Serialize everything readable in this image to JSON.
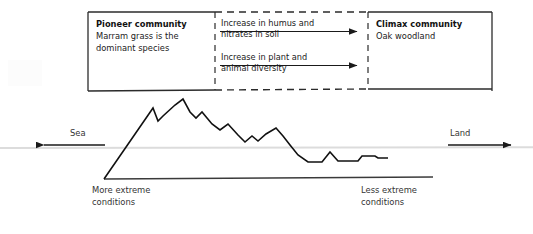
{
  "diagram": {
    "succession_box": {
      "pioneer": {
        "heading": "Pioneer community",
        "description": "Marram grass is the\ndominant species"
      },
      "climax": {
        "heading": "Climax community",
        "description": "Oak woodland"
      },
      "arrows": [
        {
          "label": "Increase in humus and\nnitrates in soil",
          "direction": "right"
        },
        {
          "label": "Increase in plant and\nanimal diversity",
          "direction": "right"
        }
      ],
      "border_style": "solid ends, dashed centre",
      "border_color": "#2b2b2b"
    },
    "profile": {
      "sea_label": "Sea",
      "land_label": "Land",
      "sea_arrow_direction": "left",
      "land_arrow_direction": "right",
      "left_condition_label": "More extreme\nconditions",
      "right_condition_label": "Less extreme\nconditions",
      "sea_level_line_color": "#d8d8d8",
      "ground_line_color": "#3a3a3a",
      "profile_line_color": "#111111"
    }
  },
  "chart_data": {
    "type": "line",
    "xlabel": "",
    "ylabel": "",
    "series": [
      {
        "name": "dune profile",
        "points": [
          [
            104,
            179
          ],
          [
            153,
            108
          ],
          [
            158,
            121
          ],
          [
            163,
            116
          ],
          [
            175,
            105
          ],
          [
            183,
            99
          ],
          [
            190,
            112
          ],
          [
            196,
            118
          ],
          [
            202,
            112
          ],
          [
            212,
            124
          ],
          [
            220,
            130
          ],
          [
            228,
            124
          ],
          [
            238,
            135
          ],
          [
            245,
            142
          ],
          [
            252,
            136
          ],
          [
            258,
            141
          ],
          [
            266,
            134
          ],
          [
            276,
            128
          ],
          [
            283,
            136
          ],
          [
            290,
            145
          ],
          [
            298,
            155
          ],
          [
            308,
            162
          ],
          [
            322,
            162
          ],
          [
            330,
            152
          ],
          [
            338,
            161
          ],
          [
            358,
            161
          ],
          [
            362,
            156
          ],
          [
            375,
            156
          ],
          [
            378,
            158
          ],
          [
            388,
            158
          ]
        ]
      }
    ],
    "reference_lines": [
      {
        "name": "sea level",
        "y": 148,
        "orientation": "horizontal",
        "style": "faint"
      },
      {
        "name": "ground baseline",
        "from": [
          104,
          179
        ],
        "to": [
          433,
          177
        ],
        "style": "solid"
      }
    ],
    "annotations": [
      {
        "text": "Sea",
        "x": 82,
        "y": 134
      },
      {
        "text": "Land",
        "x": 462,
        "y": 134
      },
      {
        "text": "More extreme conditions",
        "x": 92,
        "y": 190
      },
      {
        "text": "Less extreme conditions",
        "x": 361,
        "y": 190
      }
    ],
    "grid": false,
    "legend": "none"
  }
}
